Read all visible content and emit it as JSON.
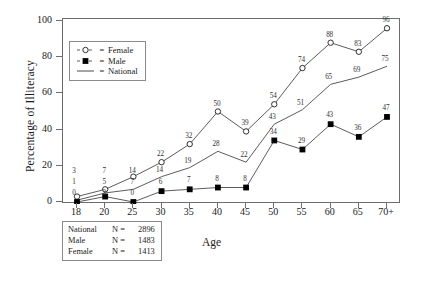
{
  "chart_data": {
    "type": "line",
    "title": "",
    "xlabel": "Age",
    "ylabel": "Percentage of Illiteracy",
    "categories": [
      "18",
      "20",
      "25",
      "30",
      "35",
      "40",
      "45",
      "50",
      "55",
      "60",
      "65",
      "70+"
    ],
    "xticks": [
      "18",
      "20",
      "25",
      "30",
      "35",
      "40",
      "45",
      "50",
      "55",
      "60",
      "65",
      "70+"
    ],
    "yticks": [
      "0",
      "20",
      "40",
      "60",
      "80",
      "100"
    ],
    "ylim": [
      0,
      100
    ],
    "grid": false,
    "legend_position": "upper-left-inside",
    "series": [
      {
        "name": "Female",
        "marker": "open-circle",
        "values": [
          3,
          7,
          14,
          22,
          32,
          50,
          39,
          54,
          74,
          88,
          83,
          96
        ],
        "labels": [
          "3",
          "7",
          "14",
          "22",
          "32",
          "50",
          "39",
          "54",
          "74",
          "88",
          "83",
          "96"
        ]
      },
      {
        "name": "National",
        "marker": "line",
        "values": [
          1,
          5,
          7,
          14,
          19,
          28,
          22,
          43,
          51,
          65,
          69,
          75
        ],
        "labels": [
          "1",
          "5",
          "7",
          "14",
          "19",
          "28",
          "22",
          "43",
          "51",
          "65",
          "69",
          "75"
        ]
      },
      {
        "name": "Male",
        "marker": "filled-square",
        "values": [
          0,
          3,
          0,
          6,
          7,
          8,
          8,
          34,
          29,
          43,
          36,
          47
        ],
        "labels": [
          "0",
          "3",
          "0",
          "6",
          "7",
          "8",
          "8",
          "34",
          "29",
          "43",
          "36",
          "47"
        ]
      }
    ]
  },
  "legend": {
    "equals": "=",
    "items": [
      {
        "label": "Female",
        "marker": "open-circle"
      },
      {
        "label": "Male",
        "marker": "filled-square"
      },
      {
        "label": "National",
        "marker": "line"
      }
    ]
  },
  "nbox": {
    "rows": [
      {
        "name": "National",
        "eq": "N  =",
        "value": "2896"
      },
      {
        "name": "Male",
        "eq": "N  =",
        "value": "1483"
      },
      {
        "name": "Female",
        "eq": "N  =",
        "value": "1413"
      }
    ]
  },
  "colors": {
    "ink": "#1a1a1a",
    "frame": "#6d6d6d",
    "line": "#4a4a4a",
    "marker_fill": "#000000",
    "background": "#ffffff"
  }
}
